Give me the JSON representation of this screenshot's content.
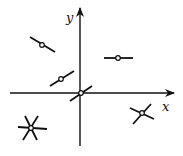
{
  "diagram": {
    "axes": {
      "x_label": "x",
      "y_label": "y",
      "color": "#111111"
    },
    "elements": [
      {
        "name": "origin-segment",
        "center": [
          81,
          93
        ],
        "angle": -35
      },
      {
        "name": "upper-left-segment",
        "center": [
          42,
          45
        ],
        "angle": 30
      },
      {
        "name": "upper-right-segment",
        "center": [
          118,
          58
        ],
        "angle": 0
      },
      {
        "name": "near-origin-segment",
        "center": [
          61,
          79
        ],
        "angle": -32
      },
      {
        "name": "lower-right-cross",
        "center": [
          142,
          113
        ],
        "type": "cross"
      },
      {
        "name": "lower-left-star",
        "center": [
          31,
          127
        ],
        "type": "star"
      }
    ]
  }
}
